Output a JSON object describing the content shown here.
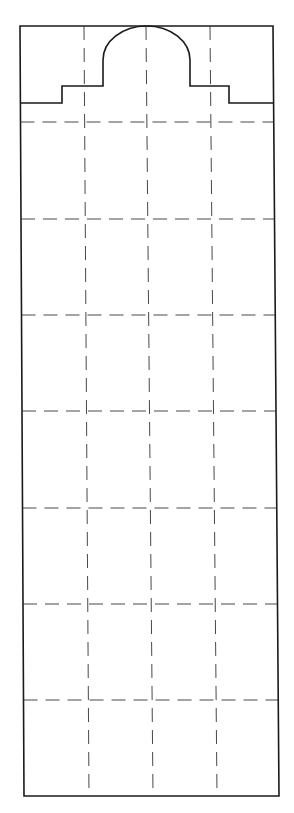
{
  "diagram": {
    "type": "template-pattern",
    "colors": {
      "background": "#ffffff",
      "outline": "#1a1a1a",
      "dash": "#333333"
    },
    "outline": {
      "top_left": [
        20,
        26
      ],
      "top_right": [
        273,
        26
      ],
      "bottom_left": [
        24,
        796
      ],
      "bottom_right": [
        279,
        796
      ]
    },
    "top_profile": {
      "left_base_y": 103,
      "left_step_x": 62,
      "step_y": 86,
      "arch_left_x": 103,
      "arch_right_x": 190,
      "arch_shoulder_y": 60,
      "arch_top_y": 26,
      "right_step_x": 229,
      "right_base_y": 103
    },
    "vertical_dashed_lines": [
      {
        "x_top": 84,
        "x_bottom": 89
      },
      {
        "x_top": 146,
        "x_bottom": 153
      },
      {
        "x_top": 210,
        "x_bottom": 217
      }
    ],
    "horizontal_dashed_lines_y": [
      122,
      219,
      315,
      411,
      508,
      604,
      700
    ]
  }
}
